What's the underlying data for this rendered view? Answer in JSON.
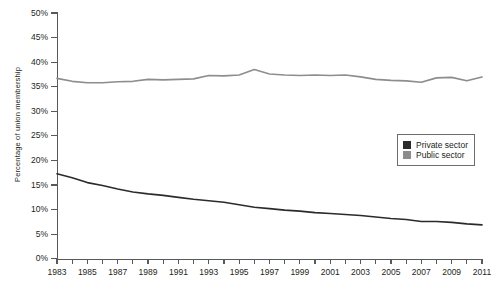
{
  "chart_data": {
    "type": "line",
    "title": "",
    "xlabel": "",
    "ylabel": "Percentage of union membership",
    "xlim": [
      1983,
      2011
    ],
    "ylim": [
      0,
      50
    ],
    "ytick_step": 5,
    "grid": false,
    "legend_position": "upper-right-inside",
    "x": [
      1983,
      1984,
      1985,
      1986,
      1987,
      1988,
      1989,
      1990,
      1991,
      1992,
      1993,
      1994,
      1995,
      1996,
      1997,
      1998,
      1999,
      2000,
      2001,
      2002,
      2003,
      2004,
      2005,
      2006,
      2007,
      2008,
      2009,
      2010,
      2011
    ],
    "ytick_labels": [
      "0%",
      "5%",
      "10%",
      "15%",
      "20%",
      "25%",
      "30%",
      "35%",
      "40%",
      "45%",
      "50%"
    ],
    "ytick_values": [
      0,
      5,
      10,
      15,
      20,
      25,
      30,
      35,
      40,
      45,
      50
    ],
    "xtick_values": [
      1983,
      1984,
      1985,
      1986,
      1987,
      1988,
      1989,
      1990,
      1991,
      1992,
      1993,
      1994,
      1995,
      1996,
      1997,
      1998,
      1999,
      2000,
      2001,
      2002,
      2003,
      2004,
      2005,
      2006,
      2007,
      2008,
      2009,
      2010,
      2011
    ],
    "xtick_labels": [
      "1983",
      "",
      "1985",
      "",
      "1987",
      "",
      "1989",
      "",
      "1991",
      "",
      "1993",
      "",
      "1995",
      "",
      "1997",
      "",
      "1999",
      "",
      "2001",
      "",
      "2003",
      "",
      "2005",
      "",
      "2007",
      "",
      "2009",
      "",
      "2011"
    ],
    "series": [
      {
        "name": "Private sector",
        "color": "#2b2b2b",
        "values": [
          17.3,
          16.5,
          15.5,
          14.9,
          14.2,
          13.6,
          13.2,
          12.9,
          12.5,
          12.1,
          11.8,
          11.5,
          11.0,
          10.5,
          10.2,
          9.9,
          9.7,
          9.4,
          9.2,
          9.0,
          8.8,
          8.5,
          8.2,
          8.0,
          7.6,
          7.6,
          7.4,
          7.1,
          6.9
        ]
      },
      {
        "name": "Public sector",
        "color": "#8d8d8d",
        "values": [
          36.7,
          36.1,
          35.8,
          35.8,
          36.0,
          36.1,
          36.5,
          36.4,
          36.5,
          36.6,
          37.3,
          37.2,
          37.4,
          38.5,
          37.6,
          37.4,
          37.3,
          37.4,
          37.3,
          37.4,
          37.0,
          36.5,
          36.3,
          36.2,
          35.9,
          36.8,
          36.9,
          36.2,
          37.0
        ]
      }
    ]
  },
  "legend": {
    "items": [
      {
        "label": "Private sector",
        "color": "#2b2b2b"
      },
      {
        "label": "Public sector",
        "color": "#8d8d8d"
      }
    ]
  }
}
